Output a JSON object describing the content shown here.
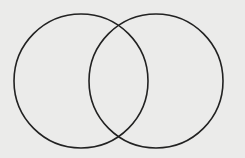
{
  "diagram": {
    "type": "venn",
    "background": "#ebebea",
    "stroke": "#222222",
    "stroke_width": 1.6,
    "circles": [
      {
        "id": "set-a",
        "cx": 81,
        "cy": 81,
        "r": 67
      },
      {
        "id": "set-b",
        "cx": 156,
        "cy": 81,
        "r": 67
      }
    ],
    "labels": []
  }
}
